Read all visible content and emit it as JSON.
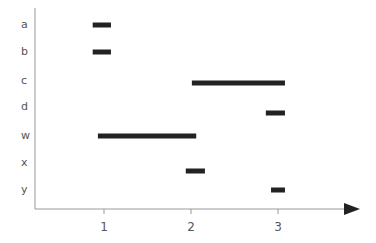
{
  "chart_data": {
    "type": "gantt-bar",
    "title": "",
    "xlabel": "",
    "ylabel": "",
    "categories": [
      "a",
      "b",
      "c",
      "d",
      "w",
      "x",
      "y"
    ],
    "x_ticks": [
      1,
      2,
      3
    ],
    "xlim": [
      0.2,
      3.95
    ],
    "grid": false,
    "legend": null,
    "series": [
      {
        "name": "intervals",
        "values": [
          {
            "category": "a",
            "start": 0.87,
            "end": 1.08
          },
          {
            "category": "b",
            "start": 0.87,
            "end": 1.08
          },
          {
            "category": "c",
            "start": 2.01,
            "end": 3.08
          },
          {
            "category": "d",
            "start": 2.86,
            "end": 3.08
          },
          {
            "category": "w",
            "start": 0.93,
            "end": 2.06
          },
          {
            "category": "x",
            "start": 1.94,
            "end": 2.16
          },
          {
            "category": "y",
            "start": 2.92,
            "end": 3.08
          }
        ]
      }
    ],
    "colors": {
      "bar": "#222222",
      "axis": "#999999",
      "text": "#555555"
    }
  }
}
